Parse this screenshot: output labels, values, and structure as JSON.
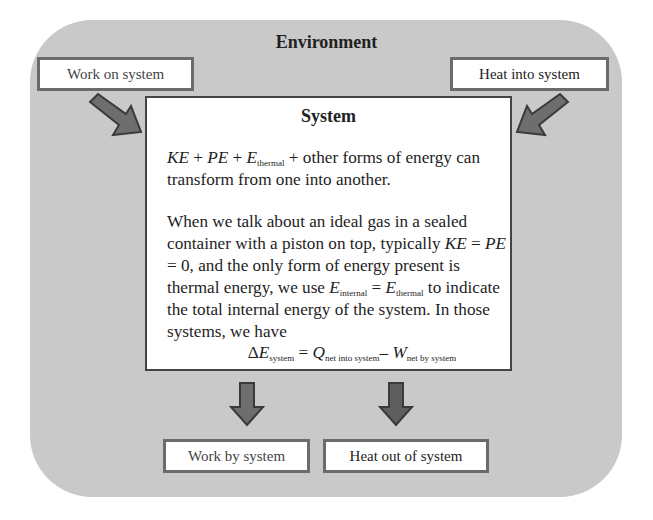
{
  "environment": {
    "title": "Environment",
    "background_color": "#c9c9c9"
  },
  "inputs": {
    "work_on_system": "Work on system",
    "heat_into_system": "Heat into system"
  },
  "outputs": {
    "work_by_system": "Work by system",
    "heat_out_of_system": "Heat out of system"
  },
  "system": {
    "title": "System",
    "para1": {
      "ke": "KE",
      "plus1": " + ",
      "pe": "PE",
      "plus2": " + ",
      "e": "E",
      "e_sub": "thermal",
      "rest": " + other forms of energy can transform from one into another."
    },
    "para2": {
      "intro": "When we talk about an ideal gas in a sealed container with a piston on top, typically ",
      "ke": "KE",
      "eq1": " = ",
      "pe": "PE",
      "eq2": " = 0, and the only form of energy present is thermal energy, we use ",
      "e1": "E",
      "e1_sub": "internal",
      "eq3": " = ",
      "e2": "E",
      "e2_sub": "thermal",
      "rest": " to indicate the total internal energy of the system. In those systems, we have"
    },
    "equation": {
      "delta": "Δ",
      "e": "E",
      "e_sub": "system",
      "equals": " = ",
      "q": "Q",
      "q_sub": "net into system",
      "minus": "– ",
      "w": "W",
      "w_sub": "net by system"
    }
  },
  "colors": {
    "arrow_fill": "#6e6e6e",
    "arrow_stroke": "#3a3a3a",
    "box_border": "#6b6b6b"
  }
}
